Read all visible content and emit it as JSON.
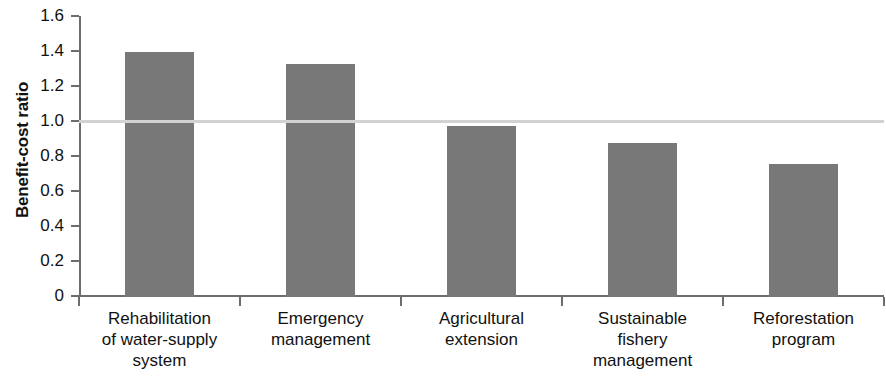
{
  "chart_data": {
    "type": "bar",
    "title": "",
    "xlabel": "",
    "ylabel": "Benefit-cost ratio",
    "ylim": [
      0,
      1.6
    ],
    "grid": false,
    "legend": null,
    "bar_color": "#787878",
    "reference_line": {
      "value": 1.0,
      "color": "#d2d2d2",
      "label": ""
    },
    "categories": [
      "Rehabilitation of water-supply system",
      "Emergency management",
      "Agricultural extension",
      "Sustainable fishery management",
      "Reforestation program"
    ],
    "category_lines": [
      [
        "Rehabilitation",
        "of water-supply",
        "system"
      ],
      [
        "Emergency",
        "management"
      ],
      [
        "Agricultural",
        "extension"
      ],
      [
        "Sustainable",
        "fishery",
        "management"
      ],
      [
        "Reforestation",
        "program"
      ]
    ],
    "values": [
      1.4,
      1.33,
      0.98,
      0.88,
      0.76
    ],
    "ytick_labels": [
      "1.6",
      "1.4",
      "1.2",
      "1.0",
      "0.8",
      "0.6",
      "0.4",
      "0.2",
      "0"
    ],
    "ytick_values": [
      1.6,
      1.4,
      1.2,
      1.0,
      0.8,
      0.6,
      0.4,
      0.2,
      0
    ]
  }
}
